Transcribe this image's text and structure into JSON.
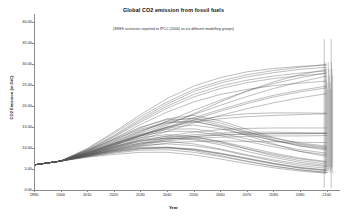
{
  "chart_data": {
    "type": "line",
    "title": "Global CO2 emission from fossil fuels",
    "subtitle": "(SRES scenarios reported to IPCC (2000) as six different modelling groups)",
    "xlabel": "Year",
    "ylabel": "CO2 Emission (in GtC)",
    "xlim": [
      1990,
      2105
    ],
    "ylim": [
      0,
      42
    ],
    "grid": false,
    "legend": "none",
    "x_ticks": [
      1990,
      2000,
      2010,
      2020,
      2030,
      2040,
      2050,
      2060,
      2070,
      2080,
      2090,
      2100
    ],
    "x_tick_labels": [
      "1990",
      "2000",
      "2010",
      "2020",
      "2030",
      "2040",
      "2050",
      "2060",
      "2070",
      "2080",
      "2090",
      "2100"
    ],
    "y_ticks": [
      0,
      5,
      10,
      15,
      20,
      25,
      30,
      35,
      40
    ],
    "y_tick_labels": [
      "0.00",
      "5.00",
      "10.00",
      "15.00",
      "20.00",
      "25.00",
      "30.00",
      "35.00",
      "40.00"
    ],
    "line_color": "#555555",
    "x": [
      1990,
      2000,
      2010,
      2020,
      2030,
      2040,
      2050,
      2060,
      2070,
      2080,
      2090,
      2100
    ],
    "annotations": [
      {
        "label": "endpoint range bars at 2100",
        "x": 2100,
        "y_from": 4.0,
        "y_to": 30.5
      }
    ],
    "series": [
      {
        "name": "A1B-AIM",
        "values": [
          6.0,
          6.9,
          9.5,
          12.0,
          14.5,
          16.2,
          16.5,
          15.0,
          13.0,
          11.0,
          9.2,
          8.0
        ]
      },
      {
        "name": "A1B-ASF",
        "values": [
          6.0,
          6.9,
          9.2,
          11.8,
          14.8,
          17.0,
          17.8,
          16.5,
          14.5,
          12.5,
          11.0,
          10.2
        ]
      },
      {
        "name": "A1B-IMAGE",
        "values": [
          6.0,
          6.9,
          9.0,
          11.4,
          14.0,
          16.4,
          17.2,
          16.0,
          14.0,
          12.0,
          10.5,
          9.5
        ]
      },
      {
        "name": "A1B-MARIA",
        "values": [
          6.0,
          6.9,
          8.6,
          10.8,
          13.0,
          14.8,
          15.5,
          14.6,
          13.2,
          11.8,
          10.8,
          10.0
        ]
      },
      {
        "name": "A1B-MESSAGE",
        "values": [
          6.0,
          6.9,
          9.3,
          12.2,
          15.0,
          16.8,
          17.0,
          15.5,
          13.5,
          11.8,
          10.5,
          9.8
        ]
      },
      {
        "name": "A1B-MiniCAM",
        "values": [
          6.0,
          6.9,
          9.1,
          11.6,
          14.2,
          16.0,
          16.3,
          15.2,
          13.8,
          12.4,
          11.2,
          10.5
        ]
      },
      {
        "name": "A1C-AIM",
        "values": [
          6.0,
          6.9,
          9.8,
          13.5,
          17.5,
          21.0,
          24.0,
          26.0,
          27.5,
          28.5,
          29.3,
          30.0
        ]
      },
      {
        "name": "A1C-MESSAGE",
        "values": [
          6.0,
          6.9,
          9.6,
          13.0,
          17.0,
          20.5,
          23.5,
          25.5,
          27.0,
          28.0,
          28.8,
          29.3
        ]
      },
      {
        "name": "A1C-MiniCAM",
        "values": [
          6.0,
          6.9,
          9.4,
          12.6,
          16.2,
          19.5,
          22.2,
          24.2,
          25.6,
          26.6,
          27.3,
          27.8
        ]
      },
      {
        "name": "A1G-AIM",
        "values": [
          6.0,
          6.9,
          9.9,
          13.8,
          18.0,
          21.8,
          24.8,
          26.8,
          28.2,
          29.0,
          29.5,
          29.8
        ]
      },
      {
        "name": "A1G-MESSAGE",
        "values": [
          6.0,
          6.9,
          9.5,
          12.8,
          16.6,
          20.0,
          22.8,
          24.8,
          26.2,
          27.2,
          27.9,
          28.4
        ]
      },
      {
        "name": "A1G-MiniCAM",
        "values": [
          6.0,
          6.9,
          9.2,
          12.2,
          15.6,
          18.6,
          21.0,
          22.8,
          24.0,
          24.9,
          25.5,
          26.0
        ]
      },
      {
        "name": "A1T-AIM",
        "values": [
          6.0,
          6.9,
          8.8,
          10.8,
          12.5,
          13.2,
          12.8,
          11.5,
          9.8,
          8.2,
          7.0,
          6.2
        ]
      },
      {
        "name": "A1T-MARIA",
        "values": [
          6.0,
          6.9,
          8.4,
          10.0,
          11.2,
          11.6,
          11.0,
          9.8,
          8.4,
          7.2,
          6.2,
          5.6
        ]
      },
      {
        "name": "A1T-MESSAGE",
        "values": [
          6.0,
          6.9,
          8.6,
          10.4,
          11.8,
          12.4,
          12.0,
          10.8,
          9.2,
          7.8,
          6.6,
          5.8
        ]
      },
      {
        "name": "A1v1-MiniCAM",
        "values": [
          6.0,
          6.9,
          9.0,
          11.2,
          13.2,
          14.5,
          14.6,
          13.6,
          12.2,
          10.8,
          9.6,
          8.8
        ]
      },
      {
        "name": "A1v2-MiniCAM",
        "values": [
          6.0,
          6.9,
          8.9,
          11.0,
          12.9,
          14.0,
          14.0,
          13.0,
          11.6,
          10.3,
          9.2,
          8.4
        ]
      },
      {
        "name": "A2-AIM",
        "values": [
          6.0,
          6.9,
          8.8,
          11.0,
          13.5,
          15.8,
          18.0,
          20.2,
          22.3,
          24.2,
          25.8,
          27.2
        ]
      },
      {
        "name": "A2-ASF",
        "values": [
          6.0,
          6.9,
          8.5,
          10.5,
          13.0,
          15.5,
          18.2,
          21.0,
          23.6,
          25.8,
          27.5,
          28.8
        ]
      },
      {
        "name": "A2-IMAGE",
        "values": [
          6.0,
          6.9,
          8.4,
          10.2,
          12.4,
          14.6,
          16.8,
          18.8,
          20.6,
          22.2,
          23.4,
          24.4
        ]
      },
      {
        "name": "A2-MESSAGE",
        "values": [
          6.0,
          6.9,
          8.6,
          10.6,
          12.8,
          15.0,
          17.2,
          19.2,
          21.0,
          22.6,
          23.8,
          24.8
        ]
      },
      {
        "name": "A2-MiniCAM",
        "values": [
          6.0,
          6.9,
          8.3,
          10.0,
          12.0,
          14.0,
          16.0,
          17.8,
          19.4,
          20.8,
          22.0,
          23.0
        ]
      },
      {
        "name": "A2G-IMAGE",
        "values": [
          6.0,
          6.9,
          8.9,
          11.2,
          13.8,
          16.4,
          19.0,
          21.4,
          23.6,
          25.4,
          26.8,
          28.0
        ]
      },
      {
        "name": "A2-A1-MiniCAM",
        "values": [
          6.0,
          6.9,
          8.7,
          10.8,
          13.0,
          15.0,
          16.6,
          17.6,
          18.2,
          18.4,
          18.4,
          18.3
        ]
      },
      {
        "name": "B1-AIM",
        "values": [
          6.0,
          6.9,
          8.0,
          9.0,
          9.8,
          10.0,
          9.6,
          8.6,
          7.4,
          6.2,
          5.2,
          4.6
        ]
      },
      {
        "name": "B1-ASF",
        "values": [
          6.0,
          6.9,
          8.2,
          9.5,
          10.6,
          11.0,
          10.6,
          9.6,
          8.2,
          6.9,
          5.8,
          5.2
        ]
      },
      {
        "name": "B1-IMAGE",
        "values": [
          6.0,
          6.9,
          7.9,
          8.8,
          9.5,
          9.6,
          9.0,
          8.0,
          6.8,
          5.7,
          4.8,
          4.2
        ]
      },
      {
        "name": "B1-MARIA",
        "values": [
          6.0,
          6.9,
          7.8,
          8.5,
          9.0,
          9.0,
          8.4,
          7.4,
          6.3,
          5.3,
          4.5,
          4.0
        ]
      },
      {
        "name": "B1-MESSAGE",
        "values": [
          6.0,
          6.9,
          8.1,
          9.2,
          10.0,
          10.2,
          9.8,
          8.8,
          7.6,
          6.4,
          5.4,
          4.8
        ]
      },
      {
        "name": "B1-MiniCAM",
        "values": [
          6.0,
          6.9,
          8.0,
          9.1,
          9.9,
          10.1,
          9.7,
          8.7,
          7.5,
          6.3,
          5.3,
          4.7
        ]
      },
      {
        "name": "B1T-MESSAGE",
        "values": [
          6.0,
          6.9,
          8.2,
          9.4,
          10.2,
          10.2,
          9.4,
          8.2,
          6.9,
          5.7,
          4.8,
          4.2
        ]
      },
      {
        "name": "B1High-MESSAGE",
        "values": [
          6.0,
          6.9,
          8.6,
          10.4,
          12.0,
          12.8,
          12.6,
          11.6,
          10.2,
          8.8,
          7.6,
          6.8
        ]
      },
      {
        "name": "B1High-MiniCAM",
        "values": [
          6.0,
          6.9,
          8.5,
          10.2,
          11.6,
          12.4,
          12.2,
          11.2,
          9.8,
          8.5,
          7.4,
          6.6
        ]
      },
      {
        "name": "B2-AIM",
        "values": [
          6.0,
          6.9,
          8.3,
          9.8,
          11.2,
          12.4,
          13.2,
          13.6,
          13.8,
          13.8,
          13.7,
          13.6
        ]
      },
      {
        "name": "B2-ASF",
        "values": [
          6.0,
          6.9,
          8.4,
          10.0,
          11.6,
          12.9,
          13.8,
          14.4,
          14.7,
          14.8,
          14.8,
          14.8
        ]
      },
      {
        "name": "B2-IMAGE",
        "values": [
          6.0,
          6.9,
          8.2,
          9.6,
          10.9,
          12.0,
          12.7,
          13.1,
          13.3,
          13.4,
          13.4,
          13.5
        ]
      },
      {
        "name": "B2-MARIA",
        "values": [
          6.0,
          6.9,
          8.1,
          9.3,
          10.4,
          11.2,
          11.6,
          11.7,
          11.6,
          11.5,
          11.4,
          11.3
        ]
      },
      {
        "name": "B2-MESSAGE",
        "values": [
          6.0,
          6.9,
          8.3,
          9.7,
          11.0,
          12.1,
          12.8,
          13.2,
          13.4,
          13.5,
          13.5,
          13.5
        ]
      },
      {
        "name": "B2-MiniCAM",
        "values": [
          6.0,
          6.9,
          8.2,
          9.5,
          10.7,
          11.7,
          12.3,
          12.6,
          12.8,
          12.9,
          12.9,
          13.0
        ]
      },
      {
        "name": "B2High-MiniCAM",
        "values": [
          6.0,
          6.9,
          8.8,
          11.0,
          13.2,
          15.0,
          16.2,
          17.0,
          17.5,
          17.8,
          18.0,
          18.2
        ]
      }
    ]
  }
}
